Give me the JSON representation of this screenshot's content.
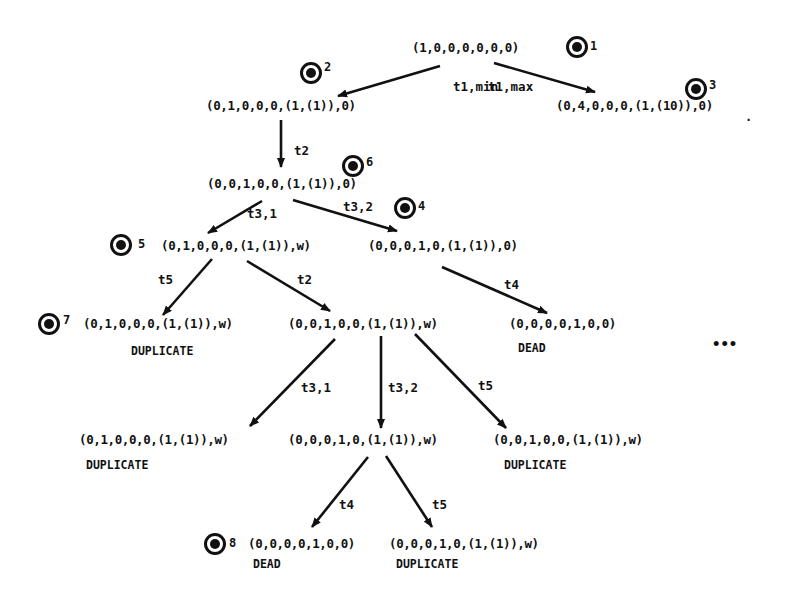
{
  "diagram": {
    "type": "reachability-tree",
    "nodes": [
      {
        "id": "n1",
        "marking": "(1,0,0,0,0,0,0)",
        "marker": "1",
        "status": ""
      },
      {
        "id": "n2",
        "marking": "(0,1,0,0,0,(1,(1)),0)",
        "marker": "2",
        "status": ""
      },
      {
        "id": "n3",
        "marking": "(0,4,0,0,0,(1,(10)),0)",
        "marker": "3",
        "status": ""
      },
      {
        "id": "n4",
        "marking": "(0,0,1,0,0,(1,(1)),0)",
        "marker": "6",
        "status": ""
      },
      {
        "id": "n5",
        "marking": "(0,1,0,0,0,(1,(1)),w)",
        "marker": "5",
        "status": ""
      },
      {
        "id": "n6",
        "marking": "(0,0,0,1,0,(1,(1)),0)",
        "marker": "4",
        "status": ""
      },
      {
        "id": "n7",
        "marking": "(0,1,0,0,0,(1,(1)),w)",
        "marker": "7",
        "status": "DUPLICATE"
      },
      {
        "id": "n8",
        "marking": "(0,0,1,0,0,(1,(1)),w)",
        "marker": "",
        "status": ""
      },
      {
        "id": "n9",
        "marking": "(0,0,0,0,1,0,0)",
        "marker": "",
        "status": "DEAD"
      },
      {
        "id": "n10",
        "marking": "(0,1,0,0,0,(1,(1)),w)",
        "marker": "",
        "status": "DUPLICATE"
      },
      {
        "id": "n11",
        "marking": "(0,0,0,1,0,(1,(1)),w)",
        "marker": "",
        "status": ""
      },
      {
        "id": "n12",
        "marking": "(0,0,1,0,0,(1,(1)),w)",
        "marker": "",
        "status": "DUPLICATE"
      },
      {
        "id": "n13",
        "marking": "(0,0,0,0,1,0,0)",
        "marker": "8",
        "status": "DEAD"
      },
      {
        "id": "n14",
        "marking": "(0,0,0,1,0,(1,(1)),w)",
        "marker": "",
        "status": "DUPLICATE"
      }
    ],
    "edges": [
      {
        "from": "n1",
        "to": "n2",
        "label": "t1,min"
      },
      {
        "from": "n1",
        "to": "n3",
        "label": "t1,max"
      },
      {
        "from": "n2",
        "to": "n4",
        "label": "t2"
      },
      {
        "from": "n4",
        "to": "n5",
        "label": "t3,1"
      },
      {
        "from": "n4",
        "to": "n6",
        "label": "t3,2"
      },
      {
        "from": "n5",
        "to": "n7",
        "label": "t5"
      },
      {
        "from": "n5",
        "to": "n8",
        "label": "t2"
      },
      {
        "from": "n6",
        "to": "n9",
        "label": "t4"
      },
      {
        "from": "n8",
        "to": "n10",
        "label": "t3,1"
      },
      {
        "from": "n8",
        "to": "n11",
        "label": "t3,2"
      },
      {
        "from": "n8",
        "to": "n12",
        "label": "t5"
      },
      {
        "from": "n11",
        "to": "n13",
        "label": "t4"
      },
      {
        "from": "n11",
        "to": "n14",
        "label": "t5"
      }
    ],
    "continuation": "•••",
    "stray_dot": "."
  }
}
